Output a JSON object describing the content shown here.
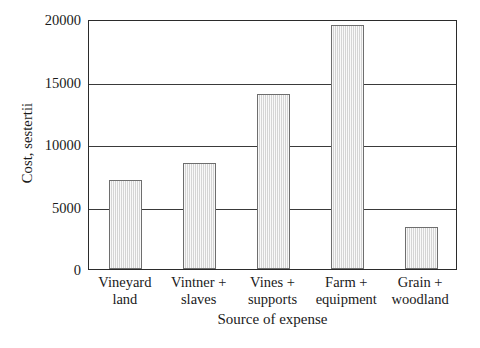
{
  "chart_data": {
    "type": "bar",
    "title": "",
    "xlabel": "Source of expense",
    "ylabel": "Cost, sestertii",
    "categories": [
      "Vineyard land",
      "Vintner + slaves",
      "Vines + supports",
      "Farm + equipment",
      "Grain + woodland"
    ],
    "category_lines": [
      [
        "Vineyard",
        "land"
      ],
      [
        "Vintner +",
        "slaves"
      ],
      [
        "Vines +",
        "supports"
      ],
      [
        "Farm +",
        "equipment"
      ],
      [
        "Grain +",
        "woodland"
      ]
    ],
    "values": [
      7100,
      8500,
      14000,
      19500,
      3400
    ],
    "ylim": [
      0,
      20000
    ],
    "yticks": [
      0,
      5000,
      10000,
      15000,
      20000
    ],
    "ytick_labels": [
      "0",
      "5000",
      "10000",
      "15000",
      "20000"
    ],
    "grid": true,
    "grid_axis": "y",
    "legend": null,
    "bar_color": "#d4d4d4",
    "bar_edge_color": "#6e6e6e",
    "bar_hatch": "vertical-lines",
    "axis_color": "#2b2b2b",
    "background_color": "#ffffff"
  }
}
